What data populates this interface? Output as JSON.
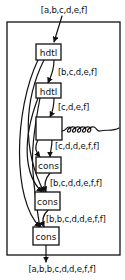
{
  "diagram": {
    "input_label": "[a,b,c,d,e,f]",
    "output_label": "[a,b,b,c,d,d,e,f,f]",
    "nodes": [
      {
        "id": "hdtl1",
        "label": "hdtl"
      },
      {
        "id": "hdtl2",
        "label": "hdtl"
      },
      {
        "id": "blank",
        "label": ""
      },
      {
        "id": "cons1",
        "label": "cons"
      },
      {
        "id": "cons2",
        "label": "cons"
      },
      {
        "id": "cons3",
        "label": "cons"
      }
    ],
    "edge_labels": [
      {
        "from": "hdtl1",
        "to": "hdtl2",
        "label": "[b,c,d,e,f]"
      },
      {
        "from": "hdtl2",
        "to": "blank",
        "label": "[c,d,e,f]"
      },
      {
        "from": "blank",
        "to": "cons1",
        "label": "[c,d,d,e,f,f]"
      },
      {
        "from": "cons1",
        "to": "cons2",
        "label": "[b,c,d,d,e,f,f]"
      },
      {
        "from": "cons2",
        "to": "cons3",
        "label": "[b,b,c,d,d,e,f,f]"
      }
    ],
    "recursion_symbol": "coil"
  }
}
